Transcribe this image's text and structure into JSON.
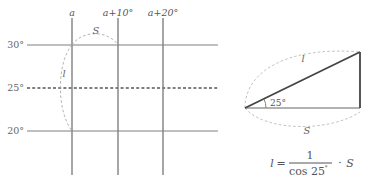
{
  "figure": {
    "colors": {
      "grid_line": "#808080",
      "dashed_curve": "#aaaaaa",
      "triangle_stroke": "#444444",
      "text": "#555555",
      "background": "#ffffff"
    }
  },
  "left_panel": {
    "name": "coordinate-grid",
    "vertical_axis_labels": [
      {
        "id": "v0",
        "text": "a",
        "x": 72
      },
      {
        "id": "v1",
        "text": "a+10°",
        "x": 118
      },
      {
        "id": "v2",
        "text": "a+20°",
        "x": 163
      }
    ],
    "horizontal_tick_labels": [
      {
        "id": "h30",
        "text": "30°",
        "y": 45
      },
      {
        "id": "h25",
        "text": "25°",
        "y": 88
      },
      {
        "id": "h20",
        "text": "20°",
        "y": 131
      }
    ],
    "curve_labels": [
      {
        "id": "s-arc",
        "text": "S"
      },
      {
        "id": "l-arc",
        "text": "l"
      }
    ]
  },
  "right_panel": {
    "name": "triangle-diagram",
    "angle_label": "25°",
    "hypotenuse_label": "l",
    "base_label": "S",
    "formula": {
      "lhs": "l",
      "equals": "=",
      "numerator": "1",
      "denominator_fn": "cos 25",
      "denominator_degree": "°",
      "multiply": "·",
      "rhs": "S"
    }
  }
}
